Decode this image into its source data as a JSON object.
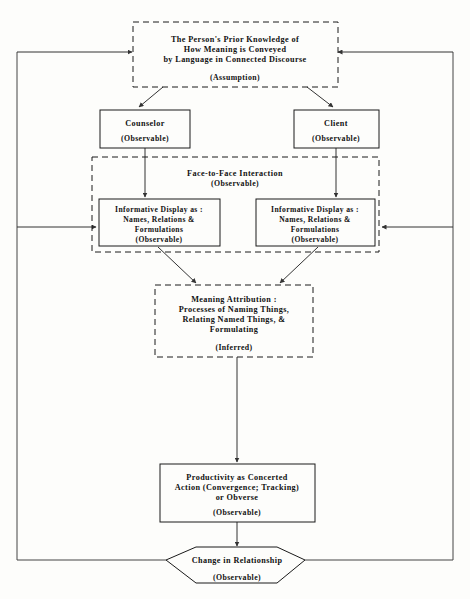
{
  "diagram": {
    "nodes": {
      "assumption": {
        "line1": "The Person's Prior Knowledge of",
        "line2": "How Meaning is Conveyed",
        "line3": "by Language in Connected Discourse",
        "tag": "(Assumption)",
        "style": "dashed"
      },
      "counselor": {
        "line1": "Counselor",
        "tag": "(Observable)",
        "style": "solid"
      },
      "client": {
        "line1": "Client",
        "tag": "(Observable)",
        "style": "solid"
      },
      "interaction": {
        "line1": "Face-to-Face Interaction",
        "tag": "(Observable)",
        "style": "dashed"
      },
      "display_left": {
        "line1": "Informative Display as :",
        "line2": "Names, Relations &",
        "line3": "Formulations",
        "tag": "(Observable)",
        "style": "solid"
      },
      "display_right": {
        "line1": "Informative Display as :",
        "line2": "Names, Relations &",
        "line3": "Formulations",
        "tag": "(Observable)",
        "style": "solid"
      },
      "meaning": {
        "line1": "Meaning Attribution :",
        "line2": "Processes of Naming Things,",
        "line3": "Relating Named Things, &",
        "line4": "Formulating",
        "tag": "(Inferred)",
        "style": "dashed"
      },
      "productivity": {
        "line1": "Productivity as Concerted",
        "line2": "Action (Convergence; Tracking)",
        "line3": "or Obverse",
        "tag": "(Observable)",
        "style": "solid"
      },
      "change": {
        "line1": "Change in Relationship",
        "tag": "(Observable)",
        "style": "hexagon"
      }
    },
    "colors": {
      "stroke": "#1a1a1a",
      "connector": "#333333",
      "frame": "#444444",
      "background": "#fdfdfb",
      "text": "#111111"
    }
  }
}
